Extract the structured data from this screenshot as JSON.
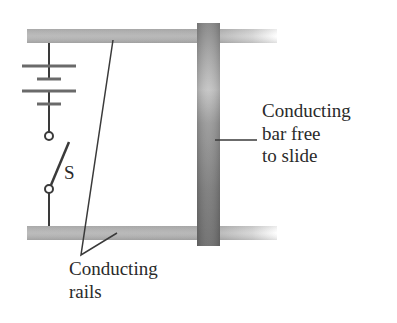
{
  "diagram": {
    "type": "circuit",
    "components": {
      "battery": {
        "name": "battery",
        "cells": 2
      },
      "switch": {
        "name": "switch",
        "label": "S"
      },
      "rails": {
        "name": "conducting-rails",
        "count": 2
      },
      "bar": {
        "name": "conducting-bar"
      }
    },
    "labels": {
      "bar": {
        "line1": "Conducting",
        "line2": "bar free",
        "line3": "to slide"
      },
      "rails": {
        "line1": "Conducting",
        "line2": "rails"
      },
      "switch": "S"
    },
    "colors": {
      "rail": "#b4b4b4",
      "bar": "#7a7a7a",
      "wire": "#3a3a3a",
      "text": "#2a2a2a"
    }
  }
}
